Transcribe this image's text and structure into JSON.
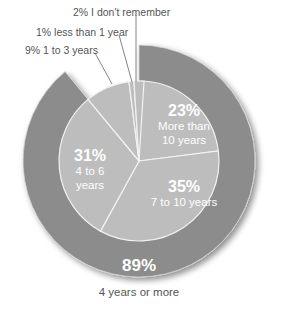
{
  "chart_data": {
    "type": "pie",
    "title": "",
    "inner_pie": {
      "start": "12 o'clock, clockwise",
      "slices": [
        {
          "label": "More than 10 years",
          "value": 23,
          "display": "23%"
        },
        {
          "label": "7 to 10 years",
          "value": 35,
          "display": "35%"
        },
        {
          "label": "4 to 6 years",
          "value": 31,
          "display": "31%"
        },
        {
          "label": "1 to 3 years",
          "value": 9,
          "display": "9%"
        },
        {
          "label": "less than 1 year",
          "value": 1,
          "display": "1%"
        },
        {
          "label": "I don't remember",
          "value": 2,
          "display": "2%"
        }
      ]
    },
    "outer_ring": {
      "label": "4 years or more",
      "value": 89,
      "display": "89%",
      "note": "Outer ring groups More than 10 years + 7 to 10 years + 4 to 6 years"
    },
    "colors": {
      "inner_fill": "#bdbdbd",
      "outer_ring": "#8c8c8c",
      "slice_border": "#f2f2f2",
      "callout_text": "#555555",
      "label_text": "#ffffff"
    }
  },
  "labels": {
    "callouts": {
      "dont_remember": "2% I don't remember",
      "less_than_1": "1% less than 1 year",
      "one_to_three": "9% 1 to 3 years"
    },
    "inner": {
      "more_than_10": {
        "pct": "23%",
        "line1": "More than",
        "line2": "10 years"
      },
      "seven_to_ten": {
        "pct": "35%",
        "line1": "7 to 10 years"
      },
      "four_to_six": {
        "pct": "31%",
        "line1": "4 to 6",
        "line2": "years"
      }
    },
    "outer": {
      "pct": "89%",
      "text": "4 years or more"
    }
  }
}
